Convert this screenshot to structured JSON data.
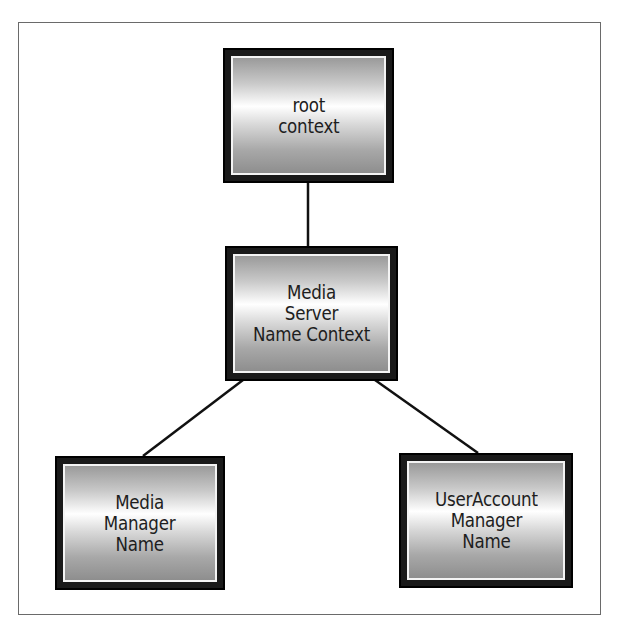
{
  "diagram": {
    "type": "tree",
    "nodes": [
      {
        "id": "root",
        "label": "root\ncontext"
      },
      {
        "id": "media-server",
        "label": "Media\nServer\nName Context"
      },
      {
        "id": "media-manager",
        "label": "Media\nManager\nName"
      },
      {
        "id": "useraccount-manager",
        "label": "UserAccount\nManager\nName"
      }
    ],
    "edges": [
      {
        "from": "root",
        "to": "media-server"
      },
      {
        "from": "media-server",
        "to": "media-manager"
      },
      {
        "from": "media-server",
        "to": "useraccount-manager"
      }
    ]
  }
}
